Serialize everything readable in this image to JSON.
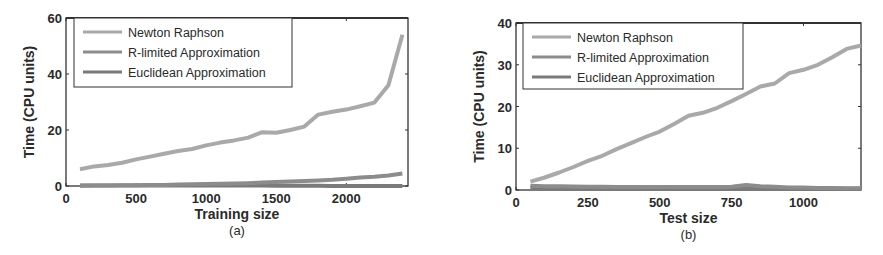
{
  "chart_data": [
    {
      "type": "line",
      "panel_label": "(a)",
      "title": "",
      "xlabel": "Training size",
      "ylabel": "Time (CPU units)",
      "xlim": [
        0,
        2440
      ],
      "ylim": [
        0,
        60
      ],
      "xticks": [
        0,
        500,
        1000,
        1500,
        2000
      ],
      "yticks": [
        0,
        20,
        40,
        60
      ],
      "grid": false,
      "legend_position": "upper left",
      "x": [
        100,
        200,
        300,
        400,
        500,
        600,
        700,
        800,
        900,
        1000,
        1100,
        1200,
        1300,
        1400,
        1500,
        1600,
        1700,
        1800,
        1900,
        2000,
        2100,
        2200,
        2300,
        2400
      ],
      "series": [
        {
          "name": "Newton Raphson",
          "color": "#a9a9a9",
          "values": [
            6,
            7,
            7.5,
            8.3,
            9.5,
            10.5,
            11.5,
            12.5,
            13.2,
            14.5,
            15.5,
            16.3,
            17.3,
            19.2,
            19,
            20,
            21.2,
            25.5,
            26.5,
            27.3,
            28.5,
            29.8,
            36,
            54
          ]
        },
        {
          "name": "R-limited Approximation",
          "color": "#8c8c8c",
          "values": [
            0.1,
            0.15,
            0.2,
            0.25,
            0.3,
            0.35,
            0.4,
            0.5,
            0.6,
            0.7,
            0.8,
            0.9,
            1.0,
            1.2,
            1.4,
            1.6,
            1.8,
            2.0,
            2.2,
            2.6,
            3.0,
            3.3,
            3.7,
            4.5
          ]
        },
        {
          "name": "Euclidean Approximation",
          "color": "#7a7a7a",
          "values": [
            0.2,
            0.2,
            0.2,
            0.2,
            0.2,
            0.2,
            0.2,
            0.2,
            0.2,
            0.2,
            0.2,
            0.2,
            0.2,
            0.2,
            0.1,
            0.1,
            0.1,
            0.1,
            0.05,
            0.05,
            0,
            0,
            0,
            0
          ]
        }
      ]
    },
    {
      "type": "line",
      "panel_label": "(b)",
      "title": "",
      "xlabel": "Test size",
      "ylabel": "Time (CPU units)",
      "xlim": [
        0,
        1200
      ],
      "ylim": [
        0,
        40
      ],
      "xticks": [
        0,
        250,
        500,
        750,
        1000
      ],
      "yticks": [
        0,
        10,
        20,
        30,
        40
      ],
      "grid": false,
      "legend_position": "upper left",
      "x": [
        50,
        100,
        150,
        200,
        250,
        300,
        350,
        400,
        450,
        500,
        550,
        600,
        650,
        700,
        750,
        800,
        850,
        900,
        950,
        1000,
        1050,
        1100,
        1150,
        1200
      ],
      "series": [
        {
          "name": "Newton Raphson",
          "color": "#a9a9a9",
          "values": [
            2,
            3,
            4.2,
            5.5,
            7,
            8.2,
            9.8,
            11.2,
            12.7,
            14,
            15.8,
            17.8,
            18.5,
            19.7,
            21.3,
            23,
            24.8,
            25.5,
            28,
            28.8,
            30,
            31.8,
            33.8,
            34.6
          ]
        },
        {
          "name": "R-limited Approximation",
          "color": "#8c8c8c",
          "values": [
            1,
            0.9,
            0.9,
            0.85,
            0.8,
            0.8,
            0.75,
            0.7,
            0.7,
            0.7,
            0.7,
            0.7,
            0.7,
            0.7,
            0.8,
            1.2,
            0.9,
            0.8,
            0.6,
            0.6,
            0.5,
            0.5,
            0.4,
            0.4
          ]
        },
        {
          "name": "Euclidean Approximation",
          "color": "#7a7a7a",
          "values": [
            0.5,
            0.5,
            0.5,
            0.5,
            0.5,
            0.5,
            0.5,
            0.5,
            0.5,
            0.5,
            0.5,
            0.5,
            0.5,
            0.5,
            0.5,
            0.4,
            0.4,
            0.4,
            0.3,
            0.3,
            0.3,
            0.3,
            0.3,
            0.3
          ]
        }
      ]
    }
  ],
  "panels": {
    "a": {
      "caption": "(a)",
      "xlabel": "Training size",
      "ylabel": "Time (CPU units)"
    },
    "b": {
      "caption": "(b)",
      "xlabel": "Test size",
      "ylabel": "Time (CPU units)"
    }
  }
}
